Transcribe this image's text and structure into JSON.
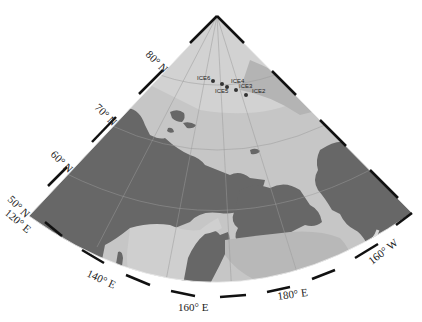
{
  "figure": {
    "type": "polar-stereographic regional map (wedge projection)",
    "region": "Arctic Ocean / Chukchi Sea / East Siberia / Bering Sea / Alaska"
  },
  "colors": {
    "land": "#666666",
    "shelf_shallow": "#cfcfcf",
    "deep_ocean": "#b5b5b5",
    "arctic_basin": "#c4c4c4",
    "frame": "#111111",
    "station_dot": "#333333"
  },
  "latitude_labels": [
    {
      "text": "80° N",
      "lat": 80
    },
    {
      "text": "70° N",
      "lat": 70
    },
    {
      "text": "60° N",
      "lat": 60
    },
    {
      "text": "50° N",
      "lat": 50
    }
  ],
  "longitude_labels": [
    {
      "text": "120° E",
      "lon": 120
    },
    {
      "text": "140° E",
      "lon": 140
    },
    {
      "text": "160° E",
      "lon": 160
    },
    {
      "text": "180° E",
      "lon": 180
    },
    {
      "text": "160° W",
      "lon": -160
    }
  ],
  "stations": [
    {
      "name": "ICE6"
    },
    {
      "name": "ICE5"
    },
    {
      "name": "ICE4"
    },
    {
      "name": "ICE3"
    },
    {
      "name": "ICE2"
    }
  ]
}
